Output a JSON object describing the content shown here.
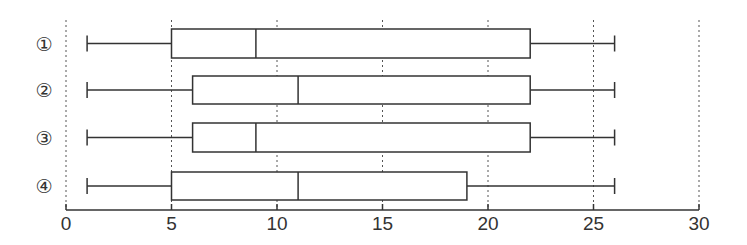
{
  "chart_data": {
    "type": "boxplot",
    "orientation": "horizontal",
    "title": "",
    "xlabel": "",
    "ylabel": "",
    "xlim": [
      0,
      30
    ],
    "xticks": [
      0,
      5,
      10,
      15,
      20,
      25,
      30
    ],
    "grid": "dotted vertical lines at each tick",
    "categories": [
      "①",
      "②",
      "③",
      "④"
    ],
    "series": [
      {
        "name": "①",
        "min": 1,
        "q1": 5,
        "median": 9,
        "q3": 22,
        "max": 26
      },
      {
        "name": "②",
        "min": 1,
        "q1": 6,
        "median": 11,
        "q3": 22,
        "max": 26
      },
      {
        "name": "③",
        "min": 1,
        "q1": 6,
        "median": 9,
        "q3": 22,
        "max": 26
      },
      {
        "name": "④",
        "min": 1,
        "q1": 5,
        "median": 11,
        "q3": 19,
        "max": 26
      }
    ]
  },
  "colors": {
    "line": "#333333",
    "grid": "#555555",
    "background": "#ffffff"
  }
}
